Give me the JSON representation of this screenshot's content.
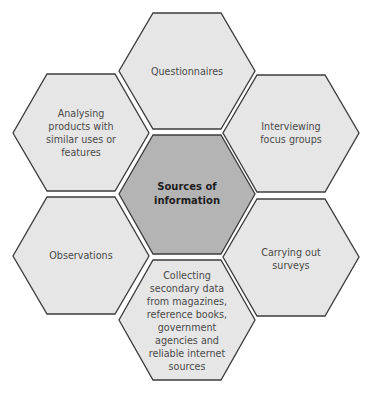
{
  "diagram": {
    "type": "hexagon-cluster",
    "colors": {
      "outer_fill": "#e6e6e6",
      "center_fill": "#b4b4b4",
      "stroke": "#3c3c3c",
      "text": "#4a4a4a",
      "center_text": "#1e1e1e"
    },
    "center": {
      "label": "Sources of\ninformation"
    },
    "nodes": [
      {
        "id": "top",
        "label": "Questionnaires"
      },
      {
        "id": "upper-right",
        "label": "Interviewing\nfocus groups"
      },
      {
        "id": "lower-right",
        "label": "Carrying out\nsurveys"
      },
      {
        "id": "bottom",
        "label": "Collecting\nsecondary data\nfrom magazines,\nreference books,\ngovernment\nagencies and\nreliable internet\nsources"
      },
      {
        "id": "lower-left",
        "label": "Observations"
      },
      {
        "id": "upper-left",
        "label": "Analysing\nproducts with\nsimilar uses or\nfeatures"
      }
    ]
  }
}
